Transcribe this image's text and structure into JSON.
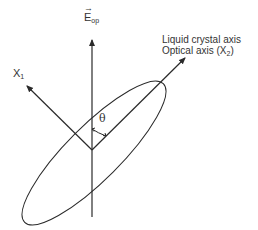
{
  "diagram": {
    "field_label": "E",
    "field_subscript": "op",
    "field_arrow": "→",
    "axis_x1_label": "X",
    "axis_x1_subscript": "1",
    "lc_axis_line1": "Liquid crystal axis",
    "lc_axis_line2_prefix": "Optical axis (X",
    "lc_axis_line2_subscript": "2",
    "lc_axis_line2_suffix": ")",
    "angle_label": "θ"
  },
  "colors": {
    "stroke": "#2a2a2a",
    "text": "#333333"
  }
}
